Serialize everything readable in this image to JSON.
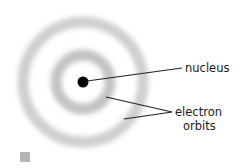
{
  "diagram": {
    "type": "atom-model",
    "labels": {
      "nucleus": "nucleus",
      "electron_orbits_line1": "electron",
      "electron_orbits_line2": "orbits"
    },
    "colors": {
      "nucleus": "#000000",
      "orbit": "#c8c8c8",
      "leader_line": "#222222",
      "text": "#1a1a1a",
      "swatch": "#b5b5b5"
    }
  }
}
